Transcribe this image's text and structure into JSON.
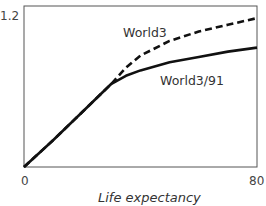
{
  "chart_data": {
    "type": "line",
    "title": "",
    "xlabel": "Life expectancy",
    "ylabel": "",
    "xlim": [
      0,
      80
    ],
    "ylim": [
      0,
      1.2
    ],
    "x_ticks": [
      0,
      80
    ],
    "y_ticks": [
      1.2
    ],
    "x_tick_labels": [
      "0",
      "80"
    ],
    "y_tick_labels": [
      "1.2"
    ],
    "grid": false,
    "legend": "inline labels",
    "series": [
      {
        "name": "World3",
        "style": "dashed",
        "label_position": {
          "x": 45,
          "y": 1.05
        },
        "x": [
          0,
          10,
          20,
          30,
          35,
          40,
          50,
          60,
          70,
          80
        ],
        "values": [
          0,
          0.2,
          0.41,
          0.62,
          0.74,
          0.83,
          0.94,
          1.01,
          1.06,
          1.11
        ]
      },
      {
        "name": "World3/91",
        "style": "solid",
        "label_position": {
          "x": 52,
          "y": 0.6
        },
        "x": [
          0,
          10,
          20,
          30,
          35,
          40,
          50,
          60,
          70,
          80
        ],
        "values": [
          0,
          0.2,
          0.41,
          0.62,
          0.68,
          0.72,
          0.78,
          0.82,
          0.86,
          0.89
        ]
      }
    ]
  },
  "labels": {
    "y_tick_top": "1.2",
    "x_tick_left": "0",
    "x_tick_right": "80",
    "x_axis_title": "Life expectancy",
    "series_world3": "World3",
    "series_world3_91": "World3/91"
  },
  "colors": {
    "line": "#111111",
    "frame": "#555555"
  }
}
